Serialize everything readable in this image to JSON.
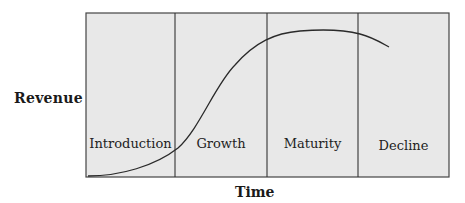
{
  "axes": {
    "y_label": "Revenue",
    "x_label": "Time"
  },
  "stages": [
    {
      "label": "Introduction"
    },
    {
      "label": "Growth"
    },
    {
      "label": "Maturity"
    },
    {
      "label": "Decline"
    }
  ],
  "colors": {
    "panel_fill": "#e8e8e8",
    "line": "#333333",
    "background": "#ffffff"
  },
  "curve": {
    "description": "S-shaped revenue curve rising slowly in Introduction, steeply in Growth, flattening to a peak in Maturity, then declining at start of Decline"
  }
}
